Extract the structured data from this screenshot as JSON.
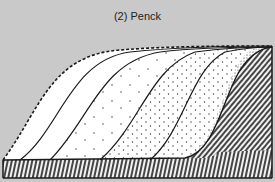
{
  "figure": {
    "title": "(2) Penck",
    "background_color": "#c9c9c9",
    "ink_color": "#1a1a1a",
    "fill_color": "#ffffff"
  },
  "diagram": {
    "elements": [
      {
        "name": "initial-surface-dashed-outline",
        "style": "dashed"
      },
      {
        "name": "slope-profile-1",
        "style": "solid",
        "fill": "sparse-dots"
      },
      {
        "name": "slope-profile-2",
        "style": "solid",
        "fill": "sparse-dots"
      },
      {
        "name": "slope-profile-3",
        "style": "solid",
        "fill": "medium-dots"
      },
      {
        "name": "slope-profile-4",
        "style": "solid",
        "fill": "dense-dots"
      },
      {
        "name": "bedrock-hatched",
        "style": "hatched"
      }
    ]
  }
}
